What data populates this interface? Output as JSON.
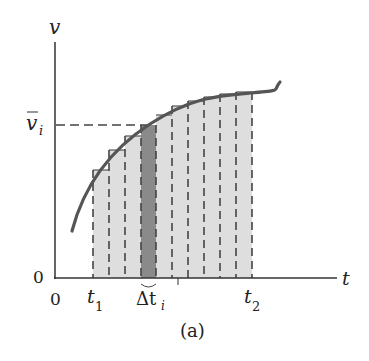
{
  "figure": {
    "caption": "(a)",
    "axes": {
      "y_label": "v",
      "x_label": "t",
      "y_origin_label": "0",
      "x_origin_label": "0"
    },
    "labels": {
      "v_bar": "v",
      "v_bar_sub": "i",
      "t1": "t",
      "t1_sub": "1",
      "t2": "t",
      "t2_sub": "2",
      "delta": "Δt",
      "delta_sub": "i"
    },
    "strips": {
      "count": 10,
      "highlighted_index": 3,
      "edges_px": [
        93,
        109,
        125,
        141,
        156,
        172,
        188,
        204,
        220,
        236,
        252
      ],
      "tops_px": [
        170,
        150,
        136,
        125,
        115,
        106,
        101,
        97,
        94,
        92
      ]
    },
    "colors": {
      "strip_fill": "#dedede",
      "highlight_fill": "#8a8a8a",
      "curve": "#555555",
      "axis": "#333333",
      "dash": "#444444"
    }
  }
}
